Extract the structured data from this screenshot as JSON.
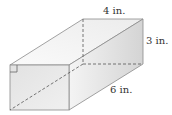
{
  "diagram": {
    "type": "rectangular-prism",
    "labels": {
      "width": "4 in.",
      "height": "3 in.",
      "length": "6 in."
    },
    "colors": {
      "edge": "#8a8a8a",
      "face_light": "#f2f2f2",
      "face_mid": "#e6e6e6",
      "face_dark": "#d6d6d6",
      "text": "#333333"
    }
  }
}
